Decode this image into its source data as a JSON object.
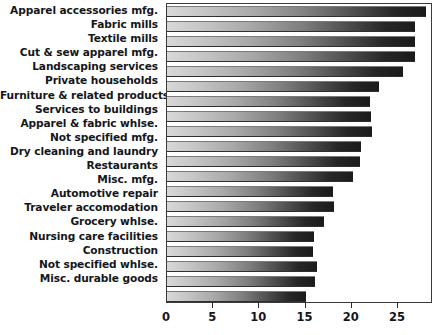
{
  "chart_data": {
    "type": "bar",
    "orientation": "horizontal",
    "title": "",
    "xlabel": "",
    "ylabel": "",
    "xlim": [
      0,
      28.8
    ],
    "grid": false,
    "legend": null,
    "xticks": [
      0,
      5,
      10,
      15,
      20,
      25
    ],
    "xtick_labels": [
      "0",
      "5",
      "10",
      "15",
      "20",
      "25"
    ],
    "categories": [
      "Apparel accessories mfg.",
      "Fabric mills",
      "Textile mills",
      "Cut & sew apparel mfg.",
      "Landscaping services",
      "Private households",
      "Furniture & related products",
      "Services to buildings",
      "Apparel & fabric whlse.",
      "Not specified mfg.",
      "Dry cleaning and laundry",
      "Restaurants",
      "Misc. mfg.",
      "Automotive repair",
      "Traveler accomodation",
      "Grocery whlse.",
      "Nursing care facilities",
      "Construction",
      "Not specified whlse.",
      "Misc. durable goods"
    ],
    "values": [
      28.0,
      26.8,
      26.8,
      26.8,
      25.5,
      23.0,
      22.0,
      22.1,
      22.2,
      21.0,
      20.9,
      20.1,
      18.0,
      18.1,
      17.0,
      15.9,
      15.8,
      16.2,
      16.0,
      15.1
    ],
    "bar_style": {
      "fill": "horizontal-gradient-light-to-dark",
      "gradient_start_color": "#d8d8d8",
      "gradient_end_color": "#1b1b1b",
      "edge_color": "#2f2f2f"
    }
  }
}
